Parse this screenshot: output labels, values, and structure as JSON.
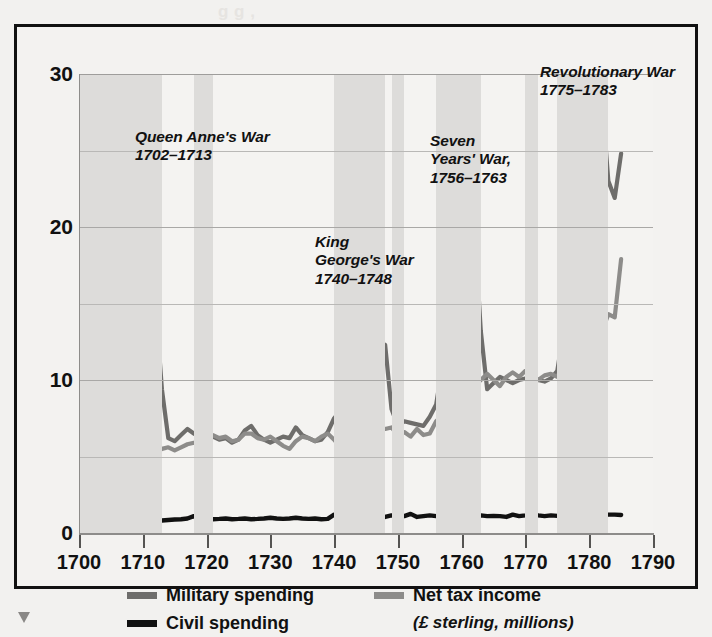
{
  "chart_data": {
    "type": "line",
    "title": "",
    "xlabel": "",
    "ylabel": "",
    "units_note": "(£ sterling, millions)",
    "xlim": [
      1700,
      1790
    ],
    "ylim": [
      0,
      30
    ],
    "yticks": [
      0,
      10,
      20,
      30
    ],
    "yticks_minor": [
      5,
      15,
      25
    ],
    "xticks": [
      1700,
      1710,
      1720,
      1730,
      1740,
      1750,
      1760,
      1770,
      1780,
      1790
    ],
    "grid": true,
    "legend_position": "bottom",
    "colors": {
      "military": "#6e6d6b",
      "tax": "#8d8c8a",
      "civil": "#111111",
      "band": "#dddcda",
      "background": "#f3f2f0"
    },
    "series": [
      {
        "name": "Military spending",
        "color": "#6e6d6b",
        "x": [
          1700,
          1701,
          1702,
          1703,
          1704,
          1705,
          1706,
          1707,
          1708,
          1709,
          1710,
          1711,
          1712,
          1713,
          1714,
          1715,
          1716,
          1717,
          1718,
          1719,
          1720,
          1721,
          1722,
          1723,
          1724,
          1725,
          1726,
          1727,
          1728,
          1729,
          1730,
          1731,
          1732,
          1733,
          1734,
          1735,
          1736,
          1737,
          1738,
          1739,
          1740,
          1741,
          1742,
          1743,
          1744,
          1745,
          1746,
          1747,
          1748,
          1749,
          1750,
          1751,
          1752,
          1753,
          1754,
          1755,
          1756,
          1757,
          1758,
          1759,
          1760,
          1761,
          1762,
          1763,
          1764,
          1765,
          1766,
          1767,
          1768,
          1769,
          1770,
          1771,
          1772,
          1773,
          1774,
          1775,
          1776,
          1777,
          1778,
          1779,
          1780,
          1781,
          1782,
          1783,
          1784,
          1785
        ],
        "values": [
          3.3,
          4.6,
          4.6,
          4.9,
          5.3,
          5.6,
          6.3,
          6.9,
          7.6,
          8.1,
          7.2,
          9.1,
          15.0,
          9.4,
          6.2,
          6.0,
          6.4,
          6.8,
          6.5,
          6.3,
          6.4,
          6.3,
          6.1,
          6.2,
          5.9,
          6.1,
          6.7,
          7.0,
          6.4,
          6.1,
          5.9,
          6.1,
          6.3,
          6.2,
          6.9,
          6.4,
          6.2,
          6.0,
          6.1,
          6.6,
          7.5,
          8.0,
          8.8,
          9.4,
          9.1,
          9.9,
          11.0,
          11.6,
          12.3,
          8.1,
          7.0,
          7.3,
          7.2,
          7.1,
          7.0,
          7.6,
          8.4,
          11.0,
          13.5,
          16.8,
          19.3,
          20.7,
          20.0,
          13.2,
          9.4,
          9.8,
          10.2,
          10.0,
          9.8,
          10.0,
          10.1,
          10.3,
          10.0,
          9.9,
          10.1,
          10.6,
          13.3,
          16.2,
          18.6,
          20.8,
          23.0,
          25.6,
          28.3,
          23.0,
          21.9,
          24.8
        ]
      },
      {
        "name": "Net tax income",
        "color": "#8d8c8a",
        "x": [
          1700,
          1701,
          1702,
          1703,
          1704,
          1705,
          1706,
          1707,
          1708,
          1709,
          1710,
          1711,
          1712,
          1713,
          1714,
          1715,
          1716,
          1717,
          1718,
          1719,
          1720,
          1721,
          1722,
          1723,
          1724,
          1725,
          1726,
          1727,
          1728,
          1729,
          1730,
          1731,
          1732,
          1733,
          1734,
          1735,
          1736,
          1737,
          1738,
          1739,
          1740,
          1741,
          1742,
          1743,
          1744,
          1745,
          1746,
          1747,
          1748,
          1749,
          1750,
          1751,
          1752,
          1753,
          1754,
          1755,
          1756,
          1757,
          1758,
          1759,
          1760,
          1761,
          1762,
          1763,
          1764,
          1765,
          1766,
          1767,
          1768,
          1769,
          1770,
          1771,
          1772,
          1773,
          1774,
          1775,
          1776,
          1777,
          1778,
          1779,
          1780,
          1781,
          1782,
          1783,
          1784,
          1785
        ],
        "values": [
          3.4,
          4.2,
          4.8,
          4.9,
          5.0,
          4.9,
          5.0,
          5.1,
          5.0,
          5.1,
          5.3,
          5.0,
          5.2,
          5.5,
          5.6,
          5.4,
          5.6,
          5.8,
          5.9,
          5.7,
          6.0,
          6.4,
          6.2,
          6.3,
          6.0,
          6.1,
          6.5,
          6.5,
          6.2,
          6.1,
          6.3,
          6.0,
          5.7,
          5.5,
          6.0,
          6.3,
          6.2,
          6.0,
          6.3,
          6.5,
          6.1,
          5.6,
          5.1,
          5.5,
          6.0,
          6.3,
          6.7,
          6.9,
          6.8,
          6.9,
          6.4,
          6.6,
          6.3,
          6.8,
          6.4,
          6.5,
          7.3,
          7.7,
          8.2,
          8.6,
          9.2,
          9.4,
          9.6,
          10.0,
          10.4,
          10.0,
          9.6,
          10.2,
          10.5,
          10.2,
          10.6,
          10.3,
          10.0,
          10.3,
          10.4,
          10.2,
          11.1,
          11.6,
          11.0,
          11.8,
          12.5,
          13.1,
          13.2,
          14.3,
          14.1,
          17.9
        ]
      },
      {
        "name": "Civil spending",
        "color": "#111111",
        "x": [
          1700,
          1701,
          1702,
          1703,
          1704,
          1705,
          1706,
          1707,
          1708,
          1709,
          1710,
          1711,
          1712,
          1713,
          1714,
          1715,
          1716,
          1717,
          1718,
          1719,
          1720,
          1721,
          1722,
          1723,
          1724,
          1725,
          1726,
          1727,
          1728,
          1729,
          1730,
          1731,
          1732,
          1733,
          1734,
          1735,
          1736,
          1737,
          1738,
          1739,
          1740,
          1741,
          1742,
          1743,
          1744,
          1745,
          1746,
          1747,
          1748,
          1749,
          1750,
          1751,
          1752,
          1753,
          1754,
          1755,
          1756,
          1757,
          1758,
          1759,
          1760,
          1761,
          1762,
          1763,
          1764,
          1765,
          1766,
          1767,
          1768,
          1769,
          1770,
          1771,
          1772,
          1773,
          1774,
          1775,
          1776,
          1777,
          1778,
          1779,
          1780,
          1781,
          1782,
          1783,
          1784,
          1785
        ],
        "values": [
          0.85,
          0.8,
          0.78,
          0.82,
          0.8,
          1.05,
          0.82,
          0.8,
          0.85,
          0.82,
          0.8,
          1.05,
          0.8,
          0.82,
          0.85,
          0.88,
          0.9,
          0.95,
          1.1,
          0.92,
          0.95,
          0.9,
          0.92,
          0.95,
          0.9,
          0.92,
          0.95,
          0.9,
          0.92,
          0.95,
          1.0,
          0.95,
          0.92,
          0.95,
          1.0,
          0.95,
          0.92,
          0.95,
          0.9,
          0.92,
          1.2,
          0.95,
          1.0,
          1.05,
          1.0,
          1.05,
          1.0,
          1.1,
          1.05,
          1.15,
          1.05,
          1.1,
          1.25,
          1.05,
          1.1,
          1.15,
          1.1,
          1.12,
          1.1,
          1.15,
          1.3,
          1.1,
          1.12,
          1.15,
          1.1,
          1.12,
          1.1,
          1.05,
          1.2,
          1.1,
          1.15,
          1.25,
          1.15,
          1.1,
          1.15,
          1.12,
          1.1,
          1.15,
          1.2,
          1.15,
          1.2,
          1.18,
          1.15,
          1.2,
          1.2,
          1.18
        ]
      }
    ],
    "shaded_bands": [
      {
        "label": "Queen Anne's War",
        "start": 1700,
        "end": 1713
      },
      {
        "label": "unnamed-early",
        "start": 1718,
        "end": 1721
      },
      {
        "label": "King George's War",
        "start": 1740,
        "end": 1748
      },
      {
        "label": "unnamed-mid",
        "start": 1749,
        "end": 1751
      },
      {
        "label": "Seven Years' War",
        "start": 1756,
        "end": 1763
      },
      {
        "label": "unnamed-late",
        "start": 1770,
        "end": 1772
      },
      {
        "label": "Revolutionary War",
        "start": 1775,
        "end": 1783
      }
    ],
    "annotations": [
      {
        "name": "queen-annes-war",
        "lines": [
          "Queen Anne's War",
          "1702–1713"
        ],
        "x": 118,
        "y": 101
      },
      {
        "name": "king-georges-war",
        "lines": [
          "King",
          "George's War",
          "1740–1748"
        ],
        "x": 298,
        "y": 206
      },
      {
        "name": "seven-years-war",
        "lines": [
          "Seven",
          "Years' War,",
          "1756–1763"
        ],
        "x": 413,
        "y": 105
      },
      {
        "name": "revolutionary-war",
        "lines": [
          "Revolutionary War",
          "1775–1783"
        ],
        "x": 523,
        "y": 36
      }
    ]
  },
  "axes": {
    "y_labels": [
      "30",
      "20",
      "10",
      "0"
    ],
    "x_labels": [
      "1700",
      "1710",
      "1720",
      "1730",
      "1740",
      "1750",
      "1760",
      "1770",
      "1780",
      "1790"
    ]
  },
  "legend": {
    "items": [
      {
        "name": "military-spending",
        "label": "Military spending",
        "color": "#6e6d6b"
      },
      {
        "name": "net-tax-income",
        "label": "Net tax income",
        "color": "#8d8c8a"
      },
      {
        "name": "civil-spending",
        "label": "Civil spending",
        "color": "#111111"
      }
    ],
    "units": "(£ sterling, millions)"
  },
  "bleed_text": [
    {
      "text": "g g  ,",
      "x": 218,
      "y": 2
    },
    {
      "text": "€ (cip) a",
      "x": 205,
      "y": 86
    },
    {
      "text": "he menuum mes",
      "x": 192,
      "y": 110
    },
    {
      "text": "(evgtuo)",
      "x": 203,
      "y": 133
    },
    {
      "text": "e  1007",
      "x": 200,
      "y": 160
    },
    {
      "text": "uouemos  t",
      "x": 196,
      "y": 186
    }
  ]
}
